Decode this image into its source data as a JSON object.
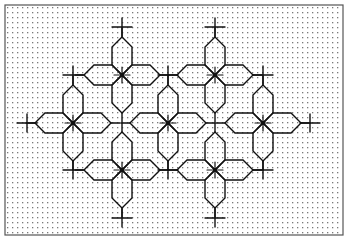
{
  "diagram": {
    "frame": {
      "x": 5,
      "y": 5,
      "width": 338,
      "height": 230,
      "stroke": "#555555"
    },
    "grid": {
      "spacing": 5,
      "dot_color": "#7a7a7a",
      "dot_size": 1.3
    },
    "line_color": "#111111",
    "unit": 47,
    "petal": {
      "length": 38,
      "half_width": 10,
      "bevel": 10
    },
    "stars": [
      {
        "x": 122,
        "y": 75
      },
      {
        "x": 215,
        "y": 75
      },
      {
        "x": 73,
        "y": 123
      },
      {
        "x": 168,
        "y": 123
      },
      {
        "x": 263,
        "y": 123
      },
      {
        "x": 122,
        "y": 170
      },
      {
        "x": 215,
        "y": 170
      }
    ],
    "crosses": [
      {
        "x": 122,
        "y": 27
      },
      {
        "x": 215,
        "y": 27
      },
      {
        "x": 73,
        "y": 75
      },
      {
        "x": 168,
        "y": 75
      },
      {
        "x": 263,
        "y": 75
      },
      {
        "x": 27,
        "y": 123
      },
      {
        "x": 310,
        "y": 123
      },
      {
        "x": 73,
        "y": 170
      },
      {
        "x": 168,
        "y": 170
      },
      {
        "x": 263,
        "y": 170
      },
      {
        "x": 122,
        "y": 218
      },
      {
        "x": 215,
        "y": 218
      }
    ]
  }
}
